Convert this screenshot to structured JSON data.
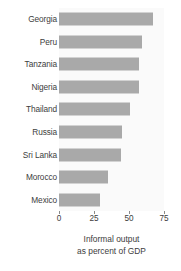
{
  "chart_data": {
    "type": "bar",
    "orientation": "horizontal",
    "title": "",
    "subtitle": "",
    "xlabel": "Informal output as percent of GDP",
    "ylabel": "",
    "categories": [
      "Georgia",
      "Peru",
      "Tanzania",
      "Nigeria",
      "Thailand",
      "Russia",
      "Sri Lanka",
      "Morocco",
      "Mexico"
    ],
    "values": [
      67,
      59,
      57,
      57,
      51,
      45,
      44,
      35,
      29
    ],
    "xlim": [
      0,
      75
    ],
    "xticks": [
      0,
      25,
      50,
      75
    ],
    "xtick_labels": [
      "0",
      "25",
      "50",
      "75"
    ],
    "grid": false,
    "legend": "none",
    "bar_color": "#a9a9a9",
    "panel_background": "#fafafa",
    "figure_background": "#ffffff",
    "text_color": "#3d3d3d"
  },
  "caption": {
    "line1": "Informal output",
    "line2": "as percent of GDP"
  }
}
